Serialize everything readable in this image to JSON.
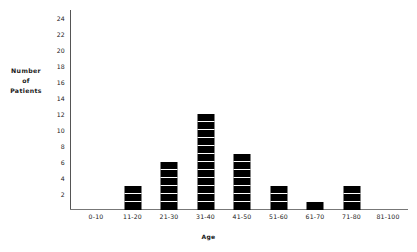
{
  "chart_data": {
    "type": "bar",
    "title": "",
    "xlabel": "Age",
    "ylabel": "Number of Patients",
    "ylabel_lines": [
      "Number",
      "of",
      "Patients"
    ],
    "categories": [
      "0-10",
      "11-20",
      "21-30",
      "31-40",
      "41-50",
      "51-60",
      "61-70",
      "71-80",
      "81-100"
    ],
    "values": [
      0,
      3,
      6,
      12,
      7,
      3,
      1,
      3,
      0
    ],
    "yticks": [
      2,
      4,
      6,
      8,
      10,
      12,
      14,
      16,
      18,
      20,
      22,
      24
    ],
    "ylim": [
      0,
      25
    ],
    "grid": false,
    "legend": false,
    "bar_style": "segmented-black",
    "colors": {
      "bar": "#000000",
      "segment_gap": "#ffffff",
      "axis": "#555555",
      "text": "#1a1a1a",
      "background": "#ffffff"
    }
  }
}
